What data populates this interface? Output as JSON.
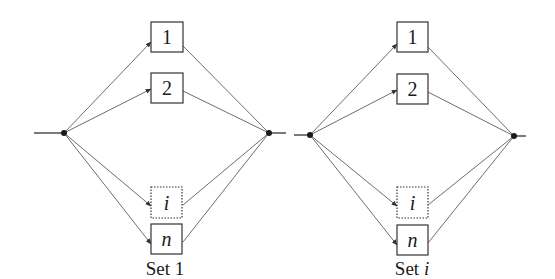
{
  "diagram": {
    "type": "parallel-series-reliability-block-diagram",
    "sets": [
      {
        "label_prefix": "Set ",
        "label_index": "1",
        "label_index_italic": false,
        "blocks": [
          {
            "label": "1",
            "italic": false,
            "style": "solid"
          },
          {
            "label": "2",
            "italic": false,
            "style": "solid"
          },
          {
            "label": "i",
            "italic": true,
            "style": "dashed"
          },
          {
            "label": "n",
            "italic": true,
            "style": "solid"
          }
        ]
      },
      {
        "label_prefix": "Set ",
        "label_index": "i",
        "label_index_italic": true,
        "blocks": [
          {
            "label": "1",
            "italic": false,
            "style": "solid"
          },
          {
            "label": "2",
            "italic": false,
            "style": "solid"
          },
          {
            "label": "i",
            "italic": true,
            "style": "dashed"
          },
          {
            "label": "n",
            "italic": true,
            "style": "solid"
          }
        ]
      }
    ],
    "colors": {
      "edge": "#6e6e6e",
      "stroke": "#333333",
      "node": "#1a1a1a",
      "background": "#ffffff"
    }
  }
}
